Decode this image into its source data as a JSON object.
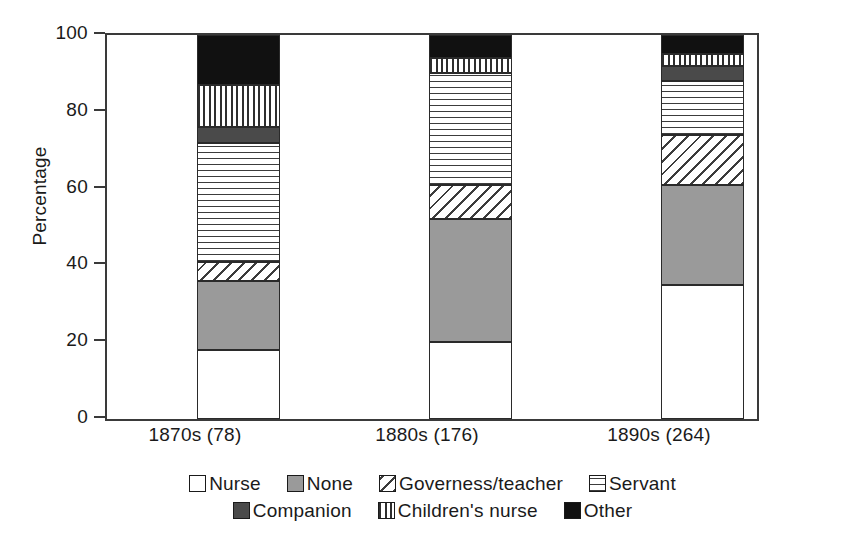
{
  "chart_data": {
    "type": "bar",
    "subtype": "stacked-bar-100-percent",
    "title": "",
    "xlabel": "",
    "ylabel": "Percentage",
    "ylim": [
      0,
      100
    ],
    "yticks": [
      0,
      20,
      40,
      60,
      80,
      100
    ],
    "ytick_labels": [
      "0",
      "20",
      "40",
      "60",
      "80",
      "100"
    ],
    "grid": false,
    "legend_position": "bottom",
    "categories": [
      "1870s (78)",
      "1880s (176)",
      "1890s (264)"
    ],
    "series": [
      {
        "name": "Nurse",
        "pattern": "solid-white",
        "values": [
          18,
          20,
          35
        ]
      },
      {
        "name": "None",
        "pattern": "solid-gray",
        "values": [
          18,
          32,
          26
        ]
      },
      {
        "name": "Governess/teacher",
        "pattern": "diagonal-hatch",
        "values": [
          5,
          9,
          13
        ]
      },
      {
        "name": "Servant",
        "pattern": "horizontal-lines",
        "values": [
          31,
          29,
          14
        ]
      },
      {
        "name": "Companion",
        "pattern": "solid-dark-gray",
        "values": [
          4,
          0,
          4
        ]
      },
      {
        "name": "Children's nurse",
        "pattern": "vertical-lines",
        "values": [
          11,
          4,
          3
        ]
      },
      {
        "name": "Other",
        "pattern": "solid-black",
        "values": [
          13,
          6,
          5
        ]
      }
    ]
  },
  "axis": {
    "y_title": "Percentage",
    "y_tick_labels": [
      "100",
      "80",
      "60",
      "40",
      "20",
      "0"
    ]
  },
  "x_labels": [
    "1870s (78)",
    "1880s (176)",
    "1890s (264)"
  ],
  "legend": {
    "row1": [
      {
        "label": "Nurse",
        "fill_class": "fill-nurse"
      },
      {
        "label": "None",
        "fill_class": "fill-none"
      },
      {
        "label": "Governess/teacher",
        "fill_class": "fill-governess"
      },
      {
        "label": "Servant",
        "fill_class": "fill-servant"
      }
    ],
    "row2": [
      {
        "label": "Companion",
        "fill_class": "fill-companion"
      },
      {
        "label": "Children's nurse",
        "fill_class": "fill-childrens"
      },
      {
        "label": "Other",
        "fill_class": "fill-other"
      }
    ]
  },
  "colors": {
    "axis": "#3a3a3a",
    "text": "#1a1a1a",
    "none_gray": "#9a9a9a",
    "companion_gray": "#4a4a4a",
    "other_black": "#111111",
    "background": "#ffffff"
  }
}
